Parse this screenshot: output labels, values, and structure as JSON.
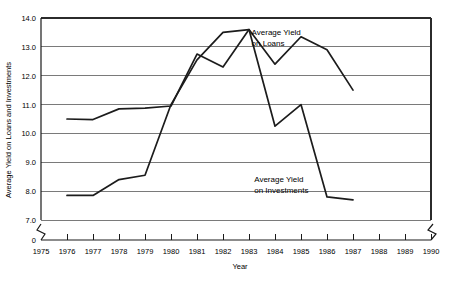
{
  "chart_data": {
    "type": "line",
    "title": "",
    "xlabel": "Year",
    "ylabel": "Average Yield on Loans and Investments",
    "xlim": [
      1975,
      1990
    ],
    "ylim": [
      7.0,
      14.0
    ],
    "y_axis_break": true,
    "y_break_label": "0",
    "x_axis_break_right": true,
    "grid": true,
    "legend_position": "inline-annotations",
    "x": [
      1976,
      1977,
      1978,
      1979,
      1980,
      1981,
      1982,
      1983,
      1984,
      1985,
      1986,
      1987
    ],
    "xticks": [
      1975,
      1976,
      1977,
      1978,
      1979,
      1980,
      1981,
      1982,
      1983,
      1984,
      1985,
      1986,
      1987,
      1988,
      1989,
      1990
    ],
    "yticks": [
      7.0,
      8.0,
      9.0,
      10.0,
      11.0,
      12.0,
      13.0,
      14.0
    ],
    "ytick_labels": [
      "7.0",
      "8.0",
      "9.0",
      "10.0",
      "11.0",
      "12.0",
      "13.0",
      "14.0"
    ],
    "series": [
      {
        "name": "Average Yield on Loans",
        "label_line1": "Average Yield",
        "label_line2": "on Loans",
        "values": [
          10.5,
          10.48,
          10.85,
          10.88,
          10.95,
          12.75,
          12.3,
          13.6,
          12.4,
          13.35,
          12.9,
          11.5
        ]
      },
      {
        "name": "Average Yield on Investments",
        "label_line1": "Average Yield",
        "label_line2": "on Investments",
        "values": [
          7.85,
          7.85,
          8.4,
          8.55,
          11.0,
          12.55,
          13.5,
          13.6,
          10.25,
          11.0,
          7.8,
          7.7
        ]
      }
    ],
    "annotations": [
      {
        "name": "loans-label",
        "text_line1": "Average Yield",
        "text_line2": "on Loans",
        "x": 1983.1,
        "y_top": 13.42
      },
      {
        "name": "investments-label",
        "text_line1": "Average Yield",
        "text_line2": "on Investments",
        "x": 1983.2,
        "y_top": 8.3
      }
    ]
  },
  "axis": {
    "x_title": "Year",
    "y_title": "Average Yield on Loans and Investments",
    "zero_marker": "0"
  }
}
